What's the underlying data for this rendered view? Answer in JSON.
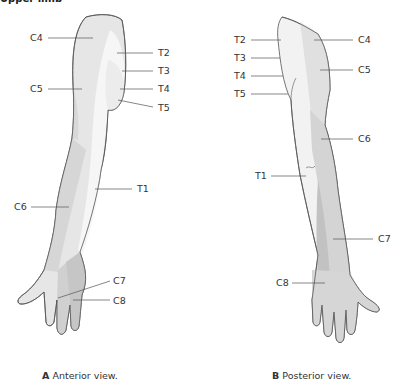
{
  "heading": "Upper limb",
  "colors": {
    "c_light": "#e6e6e6",
    "c_mid": "#d2d2d2",
    "c_dark": "#c0c0c0",
    "t_light": "#f4f4f4",
    "outline": "#555555",
    "leader": "#555555"
  },
  "panels": [
    {
      "id": "A",
      "letter": "A",
      "caption": "Anterior view.",
      "labels": [
        {
          "text": "C4",
          "x": 30,
          "y": 33
        },
        {
          "text": "T2",
          "x": 158,
          "y": 48
        },
        {
          "text": "T3",
          "x": 158,
          "y": 67
        },
        {
          "text": "C5",
          "x": 30,
          "y": 85
        },
        {
          "text": "T4",
          "x": 158,
          "y": 85
        },
        {
          "text": "T5",
          "x": 158,
          "y": 103
        },
        {
          "text": "T1",
          "x": 137,
          "y": 184
        },
        {
          "text": "C6",
          "x": 14,
          "y": 202
        },
        {
          "text": "C7",
          "x": 113,
          "y": 276
        },
        {
          "text": "C8",
          "x": 113,
          "y": 296
        }
      ]
    },
    {
      "id": "B",
      "letter": "B",
      "caption": "Posterior view.",
      "labels": [
        {
          "text": "T2",
          "x": 234,
          "y": 35
        },
        {
          "text": "C4",
          "x": 358,
          "y": 35
        },
        {
          "text": "T3",
          "x": 234,
          "y": 53
        },
        {
          "text": "T4",
          "x": 234,
          "y": 71
        },
        {
          "text": "C5",
          "x": 358,
          "y": 66
        },
        {
          "text": "T5",
          "x": 234,
          "y": 89
        },
        {
          "text": "C6",
          "x": 358,
          "y": 135
        },
        {
          "text": "T1",
          "x": 255,
          "y": 172
        },
        {
          "text": "C7",
          "x": 378,
          "y": 236
        },
        {
          "text": "C8",
          "x": 276,
          "y": 279
        }
      ]
    }
  ]
}
